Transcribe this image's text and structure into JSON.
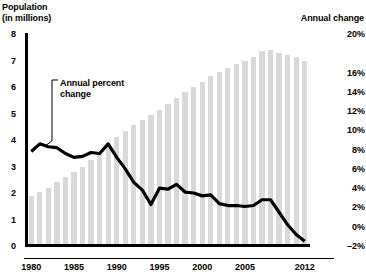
{
  "header": {
    "left_axis_title_line1": "Population",
    "left_axis_title_line2": "(in millions)",
    "right_axis_title": "Annual change"
  },
  "annotation": {
    "line1": "Annual percent",
    "line2": "change"
  },
  "colors": {
    "bar": "#d9d9d9",
    "line": "#000000",
    "axis": "#000000",
    "background": "#ffffff"
  },
  "chart_data": {
    "type": "bar",
    "title": "",
    "subtitle": "",
    "xlabel": "",
    "ylabel": "Population (in millions)",
    "y2label": "Annual change",
    "grid": false,
    "legend_position": "none",
    "ylim": [
      0,
      8
    ],
    "y2lim": [
      -2,
      20
    ],
    "yticks": [
      "0",
      "1",
      "2",
      "3",
      "4",
      "5",
      "6",
      "7",
      "8"
    ],
    "y2ticks": [
      "-2%",
      "0%",
      "2%",
      "4%",
      "6%",
      "8%",
      "10%",
      "12%",
      "14%",
      "16%",
      "18%",
      "20%"
    ],
    "y2ticks_visible": [
      "-2%",
      "0%",
      "2%",
      "4%",
      "6%",
      "8%",
      "10%",
      "12%",
      "14%",
      "16%",
      "20%"
    ],
    "xticks": [
      "1980",
      "1985",
      "1990",
      "1995",
      "2000",
      "2005",
      "2012"
    ],
    "x": [
      1980,
      1981,
      1982,
      1983,
      1984,
      1985,
      1986,
      1987,
      1988,
      1989,
      1990,
      1991,
      1992,
      1993,
      1994,
      1995,
      1996,
      1997,
      1998,
      1999,
      2000,
      2001,
      2002,
      2003,
      2004,
      2005,
      2006,
      2007,
      2008,
      2009,
      2010,
      2011,
      2012
    ],
    "series": [
      {
        "name": "Population",
        "type": "bar",
        "axis": "left",
        "unit": "millions",
        "values": [
          1.9,
          2.05,
          2.2,
          2.4,
          2.6,
          2.8,
          3.0,
          3.25,
          3.5,
          3.8,
          4.1,
          4.35,
          4.55,
          4.75,
          4.95,
          5.15,
          5.35,
          5.6,
          5.8,
          6.0,
          6.2,
          6.4,
          6.55,
          6.7,
          6.85,
          7.0,
          7.15,
          7.35,
          7.4,
          7.3,
          7.2,
          7.15,
          7.0
        ]
      },
      {
        "name": "Annual percent change",
        "type": "line",
        "axis": "right",
        "unit": "percent",
        "values": [
          7.8,
          8.6,
          8.3,
          8.2,
          7.6,
          7.2,
          7.3,
          7.7,
          7.6,
          8.6,
          7.2,
          6.0,
          4.6,
          3.8,
          2.3,
          4.0,
          3.9,
          4.4,
          3.6,
          3.5,
          3.2,
          3.3,
          2.4,
          2.2,
          2.2,
          2.1,
          2.2,
          2.8,
          2.8,
          1.5,
          0.2,
          -0.8,
          -1.5
        ]
      }
    ]
  }
}
